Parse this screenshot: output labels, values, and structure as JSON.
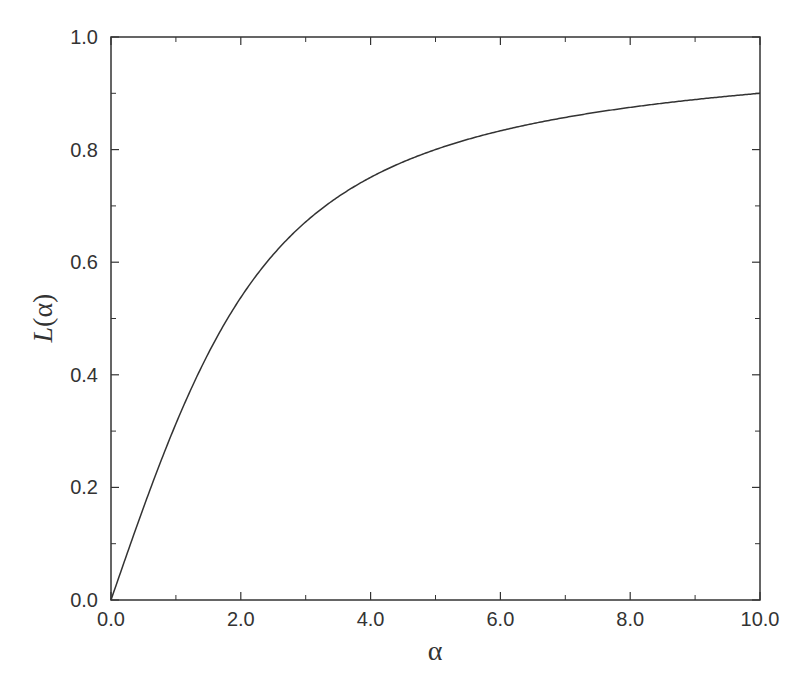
{
  "chart_data": {
    "type": "line",
    "title": "",
    "xlabel": "α",
    "ylabel": "L(α)",
    "ylabel_parts": {
      "italic": "L",
      "rest": "(α)"
    },
    "xlim": [
      0,
      10
    ],
    "ylim": [
      0,
      1
    ],
    "grid": false,
    "legend": null,
    "x_ticks": [
      0,
      2,
      4,
      6,
      8,
      10
    ],
    "x_tick_labels": [
      "0.0",
      "2.0",
      "4.0",
      "6.0",
      "8.0",
      "10.0"
    ],
    "x_minor_ticks": [
      1,
      3,
      5,
      7,
      9
    ],
    "y_ticks": [
      0,
      0.2,
      0.4,
      0.6,
      0.8,
      1.0
    ],
    "y_tick_labels": [
      "0.0",
      "0.2",
      "0.4",
      "0.6",
      "0.8",
      "1.0"
    ],
    "y_minor_ticks": [
      0.1,
      0.3,
      0.5,
      0.7,
      0.9
    ],
    "series": [
      {
        "name": "L(α) = coth(α) − 1/α",
        "color": "#333333",
        "x": [
          0,
          0.5,
          1,
          1.5,
          2,
          2.5,
          3,
          3.5,
          4,
          4.5,
          5,
          5.5,
          6,
          6.5,
          7,
          7.5,
          8,
          8.5,
          9,
          9.5,
          10
        ],
        "y": [
          0,
          0.164,
          0.313,
          0.438,
          0.537,
          0.614,
          0.672,
          0.716,
          0.751,
          0.778,
          0.8,
          0.818,
          0.834,
          0.846,
          0.857,
          0.867,
          0.875,
          0.882,
          0.889,
          0.895,
          0.9
        ]
      }
    ]
  },
  "colors": {
    "axis": "#333333",
    "line": "#333333",
    "background": "#ffffff"
  }
}
